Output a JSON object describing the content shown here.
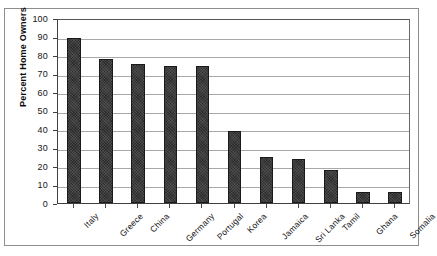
{
  "chart_data": {
    "type": "bar",
    "title": "",
    "xlabel": "",
    "ylabel": "Percent Home Owners",
    "ylim": [
      0,
      100
    ],
    "y_ticks": [
      0,
      10,
      20,
      30,
      40,
      50,
      60,
      70,
      80,
      90,
      100
    ],
    "grid": true,
    "legend": "none",
    "bar_color": "#2b2b2b",
    "categories": [
      "Italy",
      "Greece",
      "China",
      "Germany",
      "Portugal",
      "Korea",
      "Jamaica",
      "Sri Lanka",
      "Tamil",
      "Ghana",
      "Somalia"
    ],
    "values": [
      89,
      78,
      75,
      74,
      74,
      39,
      25,
      24,
      18,
      6,
      6
    ]
  }
}
